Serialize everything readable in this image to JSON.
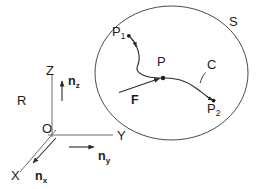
{
  "figure": {
    "colors": {
      "ink": "#1c1c1c",
      "surface_outline": "#4a4a4a",
      "axis": "#6b6b6b",
      "curve": "#2a2a2a",
      "background": "#ffffff"
    },
    "labels": {
      "surface": "S",
      "frame": "R",
      "origin": "O",
      "axis_x": "X",
      "axis_y": "Y",
      "axis_z": "Z",
      "normal_x_base": "n",
      "normal_x_sub": "x",
      "normal_y_base": "n",
      "normal_y_sub": "y",
      "normal_z_base": "n",
      "normal_z_sub": "z",
      "point_p": "P",
      "point_p1_base": "P",
      "point_p1_sub": "1",
      "point_p2_base": "P",
      "point_p2_sub": "2",
      "curve": "C",
      "force": "F"
    }
  }
}
